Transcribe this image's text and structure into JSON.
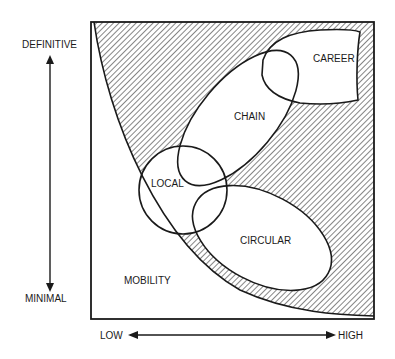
{
  "diagram": {
    "y_axis": {
      "top_label": "DEFINITIVE",
      "bottom_label": "MINIMAL"
    },
    "x_axis": {
      "left_label": "LOW",
      "right_label": "HIGH"
    },
    "regions": [
      {
        "id": "career",
        "label": "CAREER"
      },
      {
        "id": "chain",
        "label": "CHAIN"
      },
      {
        "id": "local",
        "label": "LOCAL"
      },
      {
        "id": "circular",
        "label": "CIRCULAR"
      },
      {
        "id": "mobility",
        "label": "MOBILITY"
      }
    ],
    "colors": {
      "stroke": "#1a1a1a",
      "background": "#ffffff"
    }
  }
}
